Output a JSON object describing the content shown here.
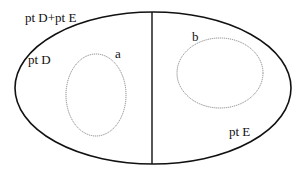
{
  "diagram": {
    "outer_label": "pt D+pt E",
    "left_region_label": "pt D",
    "right_region_label": "pt E",
    "inner_left_label": "a",
    "inner_right_label": "b"
  },
  "colors": {
    "outline": "#111111",
    "dotted": "#888888"
  }
}
